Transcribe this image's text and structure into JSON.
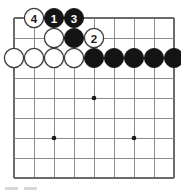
{
  "diagram": {
    "type": "go-board-diagram",
    "board": {
      "columns": 9,
      "rows": 9,
      "left_px": 14,
      "top_px": 18,
      "spacing_px": 20,
      "line_color": "#8d8d8d",
      "edge_color": "#6b6b6b",
      "background_color": "#ffffff"
    },
    "colors": {
      "black_stone": "#141414",
      "white_stone": "#ffffff",
      "white_stone_outline": "#3a3a3a",
      "black_label": "#ffffff",
      "white_label": "#1a1a1a",
      "star_point": "#1a1a1a",
      "footer_mark": "#d8d8d8"
    },
    "star_points": [
      {
        "col": 5,
        "row": 5
      },
      {
        "col": 3,
        "row": 7
      },
      {
        "col": 7,
        "row": 7
      }
    ],
    "stones": [
      {
        "id": "w-move-4",
        "color": "white",
        "col": 2,
        "row": 1,
        "label": "4",
        "move_number": 4
      },
      {
        "id": "b-move-1",
        "color": "black",
        "col": 3,
        "row": 1,
        "label": "1",
        "move_number": 1
      },
      {
        "id": "b-move-3",
        "color": "black",
        "col": 4,
        "row": 1,
        "label": "3",
        "move_number": 3
      },
      {
        "id": "w-r2-c3",
        "color": "white",
        "col": 3,
        "row": 2,
        "label": ""
      },
      {
        "id": "b-r2-c4",
        "color": "black",
        "col": 4,
        "row": 2,
        "label": ""
      },
      {
        "id": "w-move-2",
        "color": "white",
        "col": 5,
        "row": 2,
        "label": "2",
        "move_number": 2
      },
      {
        "id": "w-r3-c1",
        "color": "white",
        "col": 1,
        "row": 3,
        "label": ""
      },
      {
        "id": "w-r3-c2",
        "color": "white",
        "col": 2,
        "row": 3,
        "label": ""
      },
      {
        "id": "w-r3-c3",
        "color": "white",
        "col": 3,
        "row": 3,
        "label": ""
      },
      {
        "id": "w-r3-c4",
        "color": "white",
        "col": 4,
        "row": 3,
        "label": ""
      },
      {
        "id": "b-r3-c5",
        "color": "black",
        "col": 5,
        "row": 3,
        "label": ""
      },
      {
        "id": "b-r3-c6",
        "color": "black",
        "col": 6,
        "row": 3,
        "label": ""
      },
      {
        "id": "b-r3-c7",
        "color": "black",
        "col": 7,
        "row": 3,
        "label": ""
      },
      {
        "id": "b-r3-c8",
        "color": "black",
        "col": 8,
        "row": 3,
        "label": ""
      },
      {
        "id": "b-r3-c9",
        "color": "black",
        "col": 9,
        "row": 3,
        "label": ""
      }
    ],
    "footer": {
      "marks": [
        "mark-a",
        "mark-b"
      ]
    }
  }
}
